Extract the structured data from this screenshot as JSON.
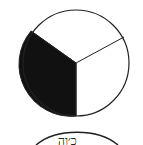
{
  "diagram": {
    "type": "fraction-circle",
    "total_parts": 3,
    "shaded_parts": 1,
    "fraction": "1/3",
    "colors": {
      "shaded": "#111111",
      "background": "#ffffff",
      "stroke": "#222222"
    }
  },
  "partial_figure": {
    "text": "ﬤ׳וﬣ"
  }
}
